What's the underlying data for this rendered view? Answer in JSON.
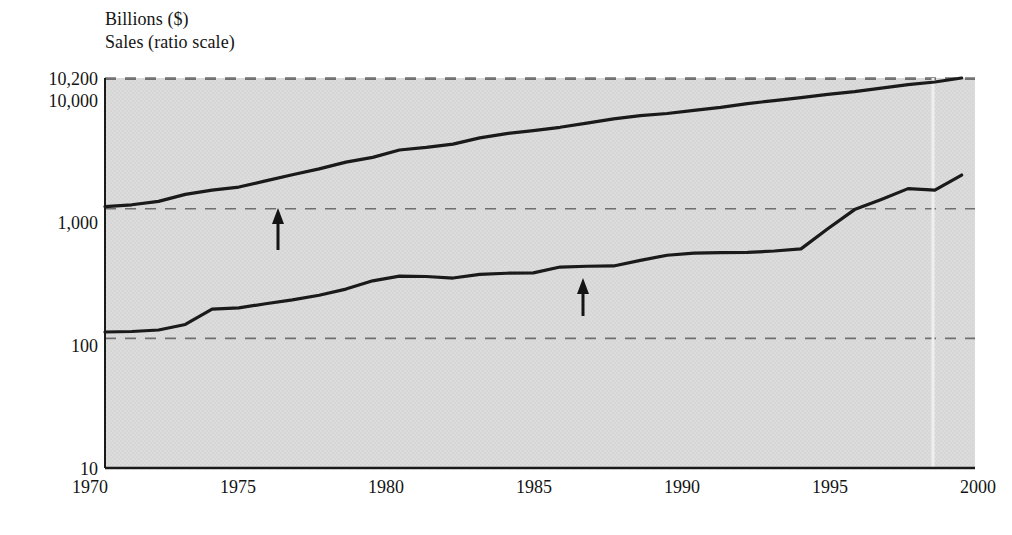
{
  "chart_data": {
    "type": "line",
    "title": "",
    "header_lines": [
      "Billions ($)",
      "Sales (ratio scale)"
    ],
    "ylabel": "Billions ($)",
    "ylabel_note": "Sales (ratio scale)",
    "xlabel": "",
    "scale": "log",
    "grid": true,
    "grid_style": "dashed-horizontal",
    "legend_position": "inline-annotations",
    "xlim": [
      1970,
      2002.5
    ],
    "ylim": [
      10,
      10200
    ],
    "yticks": [
      10,
      100,
      1000,
      10000,
      10200
    ],
    "ytick_labels": [
      "10",
      "100",
      "1,000",
      "10,000",
      "10,200"
    ],
    "xticks": [
      1970,
      1975,
      1980,
      1985,
      1990,
      1995,
      2000
    ],
    "xtick_labels": [
      "1970",
      "1975",
      "1980",
      "1985",
      "1990",
      "1995",
      "2000"
    ],
    "series": [
      {
        "name": "GDP",
        "color": "#1a1a1a",
        "annotation_label": "GDP",
        "x": [
          1970,
          1971,
          1972,
          1973,
          1974,
          1975,
          1976,
          1977,
          1978,
          1979,
          1980,
          1981,
          1982,
          1983,
          1984,
          1985,
          1986,
          1987,
          1988,
          1989,
          1990,
          1991,
          1992,
          1993,
          1994,
          1995,
          1996,
          1997,
          1998,
          1999,
          2000,
          2001,
          2002
        ],
        "values": [
          1038,
          1073,
          1140,
          1290,
          1390,
          1470,
          1640,
          1830,
          2030,
          2290,
          2490,
          2840,
          2970,
          3150,
          3520,
          3800,
          4010,
          4250,
          4570,
          4930,
          5230,
          5430,
          5740,
          6060,
          6470,
          6830,
          7190,
          7630,
          8000,
          8520,
          9080,
          9500,
          10200
        ]
      },
      {
        "name": "S&P Industrials",
        "color": "#1a1a1a",
        "annotation_label": "S&P Industrials",
        "x": [
          1970,
          1971,
          1972,
          1973,
          1974,
          1975,
          1976,
          1977,
          1978,
          1979,
          1980,
          1981,
          1982,
          1983,
          1984,
          1985,
          1986,
          1987,
          1988,
          1989,
          1990,
          1991,
          1992,
          1993,
          1994,
          1995,
          1996,
          1997,
          1998,
          1999,
          2000,
          2001,
          2002
        ],
        "values": [
          112,
          113,
          116,
          128,
          168,
          172,
          185,
          198,
          215,
          240,
          278,
          302,
          300,
          292,
          312,
          318,
          320,
          355,
          360,
          362,
          400,
          438,
          455,
          458,
          460,
          472,
          490,
          700,
          985,
          1180,
          1430,
          1390,
          1820
        ]
      }
    ],
    "annotations": [
      {
        "label": "GDP",
        "arrow_from_year": 1976.3,
        "arrow_to_year": 1976.3,
        "pointer": "up-arrow"
      },
      {
        "label": "S&P Industrials",
        "arrow_from_year": 1987.8,
        "arrow_to_year": 1987.8,
        "pointer": "up-arrow"
      }
    ],
    "colors": {
      "plot_background": "#dcdcdc",
      "line": "#1a1a1a",
      "gridline": "#6f6f6f",
      "axis": "#1a1a1a",
      "text": "#141414",
      "page_background": "#ffffff"
    }
  }
}
